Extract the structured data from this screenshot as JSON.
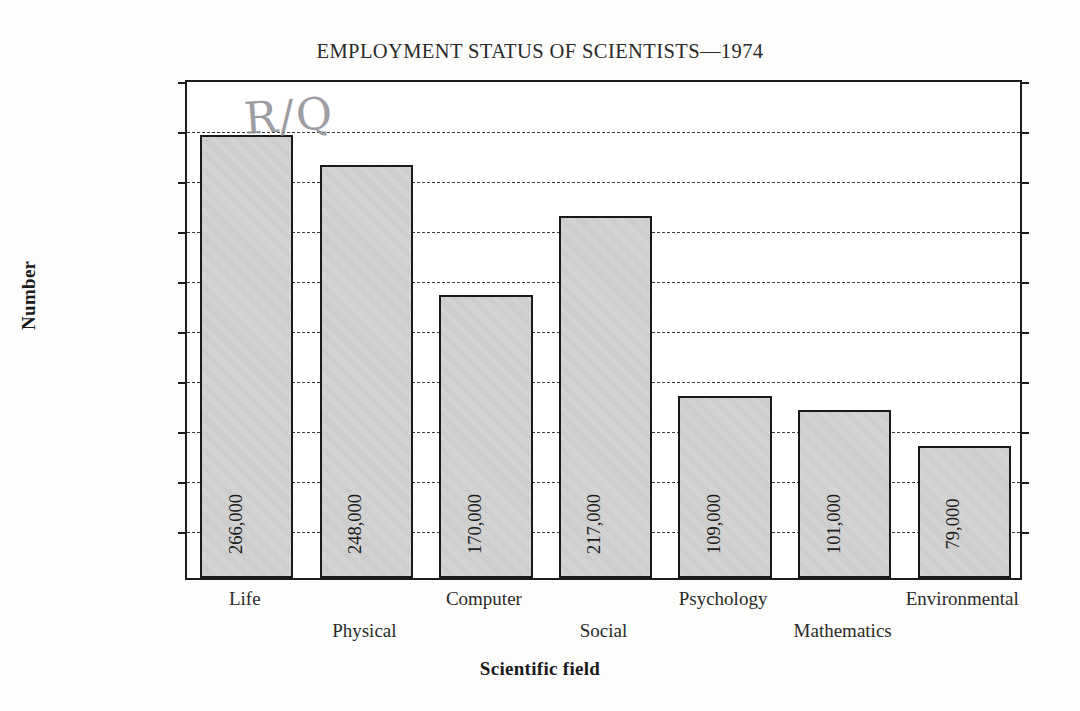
{
  "chart_data": {
    "type": "bar",
    "title": "EMPLOYMENT STATUS OF SCIENTISTS—1974",
    "xlabel": "Scientific field",
    "ylabel": "Number",
    "categories": [
      "Life",
      "Physical",
      "Computer",
      "Social",
      "Psychology",
      "Mathematics",
      "Environmental"
    ],
    "values": [
      266000,
      248000,
      170000,
      217000,
      109000,
      101000,
      79000
    ],
    "value_labels": [
      "266,000",
      "248,000",
      "170,000",
      "217,000",
      "109,000",
      "101,000",
      "79,000"
    ],
    "ylim": [
      0,
      300000
    ],
    "ytick_values": [
      0,
      30000,
      60000,
      90000,
      120000,
      150000,
      180000,
      210000,
      240000,
      270000,
      300000
    ],
    "ytick_labels": [
      "0",
      "30,000",
      "60,000",
      "90,000",
      "120,000",
      "150,000",
      "180,000",
      "210,000",
      "240,000",
      "270,000",
      "300,000"
    ],
    "grid": "horizontal-dashed",
    "legend": "none",
    "bar_fill_color": "#c9c9c9",
    "bar_edge_color": "#191919",
    "annotations": [
      "R/Q"
    ]
  },
  "annotation": {
    "handwritten_mark": "R/Q"
  }
}
